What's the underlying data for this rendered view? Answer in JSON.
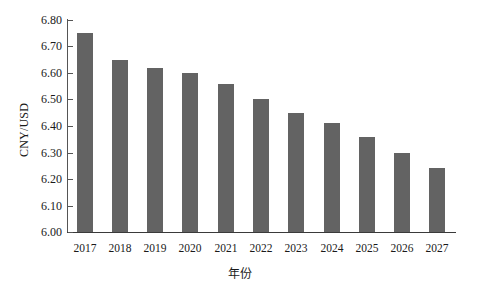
{
  "chart_data": {
    "type": "bar",
    "title": "",
    "subtitle": "",
    "xlabel": "年份",
    "ylabel": "CNY/USD",
    "categories": [
      "2017",
      "2018",
      "2019",
      "2020",
      "2021",
      "2022",
      "2023",
      "2024",
      "2025",
      "2026",
      "2027"
    ],
    "values": [
      6.75,
      6.65,
      6.62,
      6.6,
      6.56,
      6.5,
      6.45,
      6.41,
      6.36,
      6.3,
      6.24
    ],
    "ylim": [
      6.0,
      6.8
    ],
    "ytick_labels": [
      "6.80",
      "6.70",
      "6.60",
      "6.50",
      "6.40",
      "6.30",
      "6.20",
      "6.10",
      "6.00"
    ],
    "ytick_values": [
      6.8,
      6.7,
      6.6,
      6.5,
      6.4,
      6.3,
      6.2,
      6.1,
      6.0
    ],
    "grid": false,
    "legend": null,
    "legend_position": "none",
    "series": [
      {
        "name": "CNY/USD",
        "color": "#636363",
        "values": [
          6.75,
          6.65,
          6.62,
          6.6,
          6.56,
          6.5,
          6.45,
          6.41,
          6.36,
          6.3,
          6.24
        ]
      }
    ],
    "annotations": [],
    "background_color": "#ffffff",
    "axis_color": "#555555"
  }
}
